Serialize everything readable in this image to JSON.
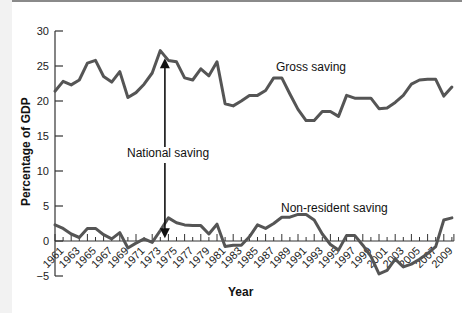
{
  "chart_data": {
    "type": "line",
    "title": "",
    "xlabel": "Year",
    "ylabel": "Percentage of GDP",
    "ylim": [
      -5,
      30
    ],
    "yticks": [
      -5,
      0,
      5,
      10,
      15,
      20,
      25,
      30
    ],
    "xtick_labels": [
      "1961",
      "1963",
      "1965",
      "1967",
      "1969",
      "1971",
      "1973",
      "1975",
      "1977",
      "1979",
      "1981",
      "1983",
      "1985",
      "1987",
      "1989",
      "1991",
      "1993",
      "1995",
      "1997",
      "1999",
      "2001",
      "2003",
      "2005",
      "2007",
      "2009"
    ],
    "grid": false,
    "x": [
      1961,
      1962,
      1963,
      1964,
      1965,
      1966,
      1967,
      1968,
      1969,
      1970,
      1971,
      1972,
      1973,
      1974,
      1975,
      1976,
      1977,
      1978,
      1979,
      1980,
      1981,
      1982,
      1983,
      1984,
      1985,
      1986,
      1987,
      1988,
      1989,
      1990,
      1991,
      1992,
      1993,
      1994,
      1995,
      1996,
      1997,
      1998,
      1999,
      2000,
      2001,
      2002,
      2003,
      2004,
      2005,
      2006,
      2007,
      2008,
      2009,
      2010
    ],
    "series": [
      {
        "name": "Gross saving",
        "values": [
          21.4,
          22.8,
          22.3,
          23.0,
          25.4,
          25.8,
          23.5,
          22.7,
          24.2,
          20.5,
          21.2,
          22.4,
          24.0,
          27.2,
          25.8,
          25.6,
          23.3,
          23.0,
          24.6,
          23.6,
          25.6,
          19.6,
          19.3,
          20.0,
          20.8,
          20.8,
          21.5,
          23.3,
          23.3,
          21.0,
          18.8,
          17.2,
          17.2,
          18.5,
          18.5,
          17.8,
          20.8,
          20.4,
          20.4,
          20.4,
          18.9,
          19.0,
          19.8,
          20.8,
          22.4,
          23.0,
          23.1,
          23.1,
          20.7,
          22.0
        ]
      },
      {
        "name": "Non-resident saving",
        "values": [
          2.3,
          1.8,
          1.0,
          0.5,
          1.8,
          1.8,
          0.9,
          0.3,
          1.2,
          -1.0,
          -0.3,
          0.3,
          -0.2,
          1.5,
          3.3,
          2.6,
          2.3,
          2.2,
          2.2,
          1.0,
          2.4,
          -0.8,
          -0.6,
          -0.6,
          0.6,
          2.3,
          1.8,
          2.5,
          3.4,
          3.4,
          3.8,
          3.8,
          3.0,
          1.0,
          -0.5,
          -1.3,
          0.8,
          0.8,
          -0.6,
          -2.2,
          -4.7,
          -4.2,
          -2.6,
          -3.7,
          -3.3,
          -2.6,
          -1.8,
          -0.8,
          3.0,
          3.3
        ]
      }
    ],
    "annotations": [
      {
        "text": "Gross saving",
        "x": 1988,
        "y": 24.8
      },
      {
        "text": "Non-resident saving",
        "x": 1987,
        "y": 4.6
      },
      {
        "text": "National saving",
        "x": 1971,
        "y": 12.6,
        "arrow": "double-headed vertical at 1975 from 0 to 26"
      }
    ],
    "legend": "none"
  },
  "labels": {
    "y_axis_title": "Percentage of GDP",
    "x_axis_title": "Year",
    "gross": "Gross saving",
    "nonres": "Non-resident saving",
    "national": "National saving"
  },
  "colors": {
    "line": "#555555",
    "axis": "#333333",
    "arrow": "#111111"
  }
}
